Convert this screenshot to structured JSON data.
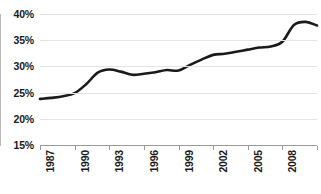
{
  "chart_data": {
    "type": "line",
    "title": "",
    "subtitle": "",
    "xlabel": "",
    "ylabel": "",
    "grid": "horizontal",
    "legend": "none",
    "xlim": [
      1987,
      2011
    ],
    "ylim": [
      15,
      40
    ],
    "ytick_values": [
      40,
      35,
      30,
      25,
      20,
      15
    ],
    "ytick_labels": [
      "40%",
      "35%",
      "30%",
      "25%",
      "20%",
      "15%"
    ],
    "xtick_values": [
      1987,
      1990,
      1993,
      1996,
      1999,
      2002,
      2005,
      2008,
      2011
    ],
    "xtick_labels": [
      "1987",
      "1990",
      "1993",
      "1996",
      "1999",
      "2002",
      "2005",
      "2008",
      "2011"
    ],
    "x": [
      1987,
      1988,
      1989,
      1990,
      1991,
      1992,
      1993,
      1994,
      1995,
      1996,
      1997,
      1998,
      1999,
      2000,
      2001,
      2002,
      2003,
      2004,
      2005,
      2006,
      2007,
      2008,
      2009,
      2010,
      2011
    ],
    "series": [
      {
        "name": "series-1",
        "color": "#1a1a1a",
        "values": [
          23.8,
          24.0,
          24.3,
          24.9,
          26.6,
          28.8,
          29.4,
          29.0,
          28.4,
          28.6,
          28.9,
          29.3,
          29.2,
          30.3,
          31.3,
          32.2,
          32.4,
          32.8,
          33.2,
          33.6,
          33.8,
          34.7,
          37.9,
          38.5,
          37.8
        ]
      }
    ],
    "colors": {
      "line": "#1a1a1a",
      "grid": "#e3e3e3",
      "axis": "#9a9a9a",
      "text": "#1a1a1a",
      "background": "#ffffff"
    }
  }
}
